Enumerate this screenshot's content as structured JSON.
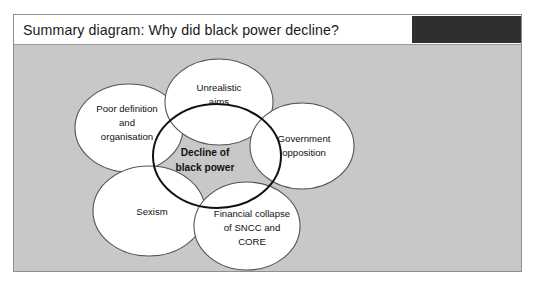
{
  "header": {
    "title": "Summary diagram: Why did black power decline?",
    "block_color": "#2f2f2f"
  },
  "panel": {
    "background_color": "#c8c8c8",
    "border_color": "#8f8f8f"
  },
  "diagram": {
    "type": "venn-cluster",
    "center": {
      "id": "decline-of-black-power",
      "lines": [
        "Decline of",
        "black power"
      ],
      "line1": "Decline of",
      "line2": "black power",
      "bold": true,
      "stroke_color": "#111111",
      "fill_color": "#ffffff"
    },
    "nodes": [
      {
        "id": "unrealistic-aims",
        "lines": [
          "Unrealistic",
          "aims"
        ],
        "line1": "Unrealistic",
        "line2": "aims",
        "line3": "",
        "stroke_color": "#555555",
        "fill_color": "#ffffff"
      },
      {
        "id": "poor-definition-and-organisation",
        "lines": [
          "Poor definition",
          "and",
          "organisation"
        ],
        "line1": "Poor definition",
        "line2": "and",
        "line3": "organisation",
        "stroke_color": "#555555",
        "fill_color": "#ffffff"
      },
      {
        "id": "government-opposition",
        "lines": [
          "Government",
          "opposition"
        ],
        "line1": "Government",
        "line2": "opposition",
        "line3": "",
        "stroke_color": "#555555",
        "fill_color": "#ffffff"
      },
      {
        "id": "financial-collapse-of-sncc-and-core",
        "lines": [
          "Financial collapse",
          "of SNCC and",
          "CORE"
        ],
        "line1": "Financial collapse",
        "line2": "of SNCC and",
        "line3": "CORE",
        "stroke_color": "#555555",
        "fill_color": "#ffffff"
      },
      {
        "id": "sexism",
        "lines": [
          "Sexism"
        ],
        "line1": "Sexism",
        "line2": "",
        "line3": "",
        "stroke_color": "#555555",
        "fill_color": "#ffffff"
      }
    ]
  }
}
